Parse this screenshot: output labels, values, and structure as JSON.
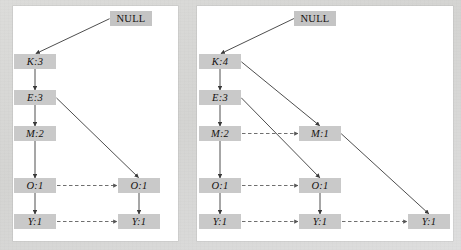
{
  "figure": {
    "background_color": "#d8d8d6",
    "panel_color": "#ffffff",
    "node_fill": "#c9c9c9",
    "edge_color": "#3a3a3a",
    "link_color": "#555555"
  },
  "panels": [
    {
      "id": "left",
      "name": "fp-tree-stage-left",
      "nodes": [
        {
          "id": "L-null",
          "label": "NULL",
          "x": 110,
          "y": 11,
          "w": 42,
          "type": "root"
        },
        {
          "id": "L-k",
          "label": "K:3",
          "x": 14,
          "y": 54,
          "w": 42,
          "type": "item"
        },
        {
          "id": "L-e",
          "label": "E:3",
          "x": 14,
          "y": 90,
          "w": 42,
          "type": "item"
        },
        {
          "id": "L-m",
          "label": "M:2",
          "x": 14,
          "y": 126,
          "w": 42,
          "type": "item"
        },
        {
          "id": "L-o1",
          "label": "O:1",
          "x": 14,
          "y": 178,
          "w": 42,
          "type": "item"
        },
        {
          "id": "L-y1",
          "label": "Y:1",
          "x": 14,
          "y": 214,
          "w": 42,
          "type": "item"
        },
        {
          "id": "L-o2",
          "label": "O:1",
          "x": 118,
          "y": 178,
          "w": 42,
          "type": "item"
        },
        {
          "id": "L-y2",
          "label": "Y:1",
          "x": 118,
          "y": 214,
          "w": 42,
          "type": "item"
        }
      ],
      "tree_edges": [
        {
          "from": "L-null",
          "to": "L-k"
        },
        {
          "from": "L-k",
          "to": "L-e"
        },
        {
          "from": "L-e",
          "to": "L-m"
        },
        {
          "from": "L-m",
          "to": "L-o1"
        },
        {
          "from": "L-o1",
          "to": "L-y1"
        },
        {
          "from": "L-e",
          "to": "L-o2"
        },
        {
          "from": "L-o2",
          "to": "L-y2"
        }
      ],
      "node_links": [
        {
          "from": "L-o1",
          "to": "L-o2"
        },
        {
          "from": "L-y1",
          "to": "L-y2"
        }
      ]
    },
    {
      "id": "right",
      "name": "fp-tree-stage-right",
      "nodes": [
        {
          "id": "R-null",
          "label": "NULL",
          "x": 294,
          "y": 11,
          "w": 42,
          "type": "root"
        },
        {
          "id": "R-k",
          "label": "K:4",
          "x": 199,
          "y": 54,
          "w": 42,
          "type": "item"
        },
        {
          "id": "R-e",
          "label": "E:3",
          "x": 199,
          "y": 90,
          "w": 42,
          "type": "item"
        },
        {
          "id": "R-m",
          "label": "M:2",
          "x": 199,
          "y": 126,
          "w": 42,
          "type": "item"
        },
        {
          "id": "R-o1",
          "label": "O:1",
          "x": 199,
          "y": 178,
          "w": 42,
          "type": "item"
        },
        {
          "id": "R-y1",
          "label": "Y:1",
          "x": 199,
          "y": 214,
          "w": 42,
          "type": "item"
        },
        {
          "id": "R-m2",
          "label": "M:1",
          "x": 299,
          "y": 126,
          "w": 42,
          "type": "item"
        },
        {
          "id": "R-o2",
          "label": "O:1",
          "x": 299,
          "y": 178,
          "w": 42,
          "type": "item"
        },
        {
          "id": "R-y2",
          "label": "Y:1",
          "x": 299,
          "y": 214,
          "w": 42,
          "type": "item"
        },
        {
          "id": "R-y3",
          "label": "Y:1",
          "x": 408,
          "y": 214,
          "w": 42,
          "type": "item"
        }
      ],
      "tree_edges": [
        {
          "from": "R-null",
          "to": "R-k"
        },
        {
          "from": "R-k",
          "to": "R-e"
        },
        {
          "from": "R-e",
          "to": "R-m"
        },
        {
          "from": "R-m",
          "to": "R-o1"
        },
        {
          "from": "R-o1",
          "to": "R-y1"
        },
        {
          "from": "R-k",
          "to": "R-m2"
        },
        {
          "from": "R-e",
          "to": "R-o2"
        },
        {
          "from": "R-o2",
          "to": "R-y2"
        },
        {
          "from": "R-m2",
          "to": "R-y3"
        }
      ],
      "node_links": [
        {
          "from": "R-m",
          "to": "R-m2"
        },
        {
          "from": "R-o1",
          "to": "R-o2"
        },
        {
          "from": "R-y1",
          "to": "R-y2"
        },
        {
          "from": "R-y2",
          "to": "R-y3"
        }
      ]
    }
  ]
}
